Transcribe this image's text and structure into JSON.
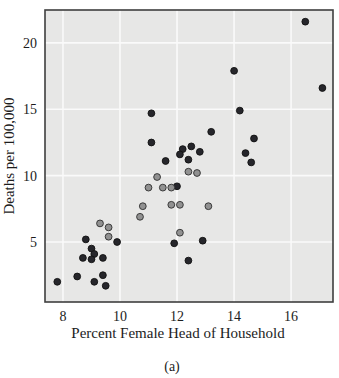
{
  "figure": {
    "caption": "(a)"
  },
  "chart_data": {
    "type": "scatter",
    "title": "",
    "xlabel": "Percent Female Head of Household",
    "ylabel": "Deaths per 100,000",
    "xlim": [
      7.37,
      17.47
    ],
    "ylim": [
      0.48,
      22.48
    ],
    "x_ticks": [
      8,
      10,
      12,
      14,
      16
    ],
    "y_ticks": [
      5,
      10,
      15,
      20
    ],
    "grid": true,
    "legend_position": "none",
    "plot_bg_color": "#e7e7e6",
    "grid_color": "#fafafa",
    "border_color": "#3f3f3f",
    "marker_radius": 3.4,
    "series": [
      {
        "name": "dark-points",
        "marker": "circle",
        "fill_color": "#26262b",
        "edge_color": "#111111",
        "points": [
          [
            16.5,
            21.6
          ],
          [
            14.0,
            17.9
          ],
          [
            17.1,
            16.6
          ],
          [
            14.2,
            14.9
          ],
          [
            11.1,
            14.7
          ],
          [
            13.2,
            13.3
          ],
          [
            14.7,
            12.8
          ],
          [
            11.1,
            12.5
          ],
          [
            12.5,
            12.2
          ],
          [
            12.2,
            12.0
          ],
          [
            12.8,
            11.8
          ],
          [
            14.4,
            11.7
          ],
          [
            12.1,
            11.6
          ],
          [
            12.4,
            11.2
          ],
          [
            11.6,
            11.1
          ],
          [
            14.6,
            11.0
          ],
          [
            12.0,
            9.2
          ],
          [
            12.9,
            5.1
          ],
          [
            11.9,
            4.9
          ],
          [
            12.4,
            3.6
          ],
          [
            8.8,
            5.2
          ],
          [
            9.9,
            5.0
          ],
          [
            9.0,
            4.5
          ],
          [
            9.1,
            4.1
          ],
          [
            8.7,
            3.8
          ],
          [
            9.0,
            3.7
          ],
          [
            9.4,
            3.8
          ],
          [
            8.5,
            2.4
          ],
          [
            9.4,
            2.5
          ],
          [
            9.1,
            2.0
          ],
          [
            9.5,
            1.7
          ],
          [
            7.8,
            2.0
          ]
        ]
      },
      {
        "name": "gray-points",
        "marker": "circle",
        "fill_color": "#919191",
        "edge_color": "#2e2e2e",
        "points": [
          [
            12.4,
            10.3
          ],
          [
            12.7,
            10.2
          ],
          [
            11.3,
            9.9
          ],
          [
            11.0,
            9.1
          ],
          [
            11.5,
            9.1
          ],
          [
            11.8,
            9.1
          ],
          [
            10.8,
            7.7
          ],
          [
            11.8,
            7.8
          ],
          [
            12.1,
            7.8
          ],
          [
            13.1,
            7.7
          ],
          [
            10.7,
            6.9
          ],
          [
            9.3,
            6.4
          ],
          [
            9.6,
            6.1
          ],
          [
            9.6,
            5.4
          ],
          [
            12.1,
            5.7
          ]
        ]
      }
    ]
  }
}
